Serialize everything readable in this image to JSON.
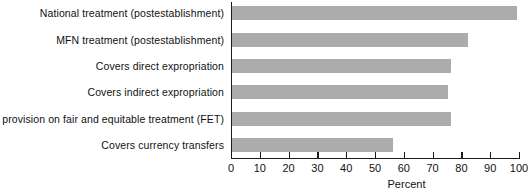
{
  "chart_data": {
    "type": "bar",
    "orientation": "horizontal",
    "title": "",
    "xlabel": "Percent",
    "ylabel": "",
    "xlim": [
      0,
      100
    ],
    "xticks": [
      0,
      10,
      20,
      30,
      40,
      50,
      60,
      70,
      80,
      90,
      100
    ],
    "grid": false,
    "legend": false,
    "bar_color": "#acacac",
    "axis_color": "#1a1a1a",
    "background": "#ffffff",
    "categories": [
      "National treatment (postestablishment)",
      "MFN treatment (postestablishment)",
      "Covers direct expropriation",
      "Covers indirect expropriation",
      "Includes provision on fair and equitable treatment (FET)",
      "Covers currency transfers"
    ],
    "values": [
      99,
      82,
      76,
      75,
      76,
      56
    ]
  }
}
